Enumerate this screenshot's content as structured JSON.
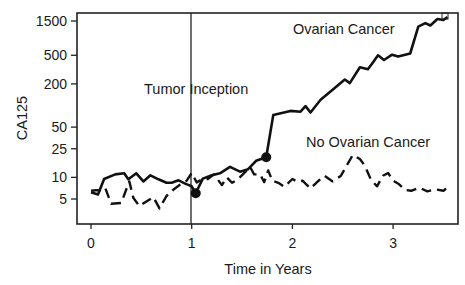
{
  "chart_data": {
    "type": "line",
    "title": "",
    "xlabel": "Time in Years",
    "ylabel": "CA125",
    "xlim": [
      -0.14,
      3.65
    ],
    "ylim_log": [
      2.0,
      2000
    ],
    "yscale": "log",
    "grid": false,
    "legend": "none (inline annotations)",
    "x_ticks": [
      0,
      1,
      2,
      3
    ],
    "x_tick_labels": [
      "0",
      "1",
      "2",
      "3"
    ],
    "y_ticks": [
      5,
      10,
      25,
      50,
      200,
      500,
      1500
    ],
    "y_tick_labels": [
      "5",
      "10",
      "25",
      "50",
      "200",
      "500",
      "1500"
    ],
    "annotations": [
      {
        "text": "Tumor Inception",
        "x": 1.0,
        "type": "vertical-line"
      },
      {
        "text": "Ovarian Cancer",
        "series": "Ovarian Cancer"
      },
      {
        "text": "No Ovarian Cancer",
        "series": "No Ovarian Cancer"
      }
    ],
    "series": [
      {
        "name": "Ovarian Cancer",
        "style": "solid",
        "x": [
          0.0,
          0.07,
          0.13,
          0.24,
          0.33,
          0.37,
          0.45,
          0.52,
          0.59,
          0.67,
          0.75,
          0.8,
          0.87,
          0.94,
          1.0,
          1.04,
          1.11,
          1.2,
          1.28,
          1.38,
          1.48,
          1.56,
          1.64,
          1.74,
          1.81,
          1.98,
          2.08,
          2.13,
          2.18,
          2.28,
          2.42,
          2.52,
          2.57,
          2.67,
          2.75,
          2.79,
          2.85,
          2.91,
          2.99,
          3.05,
          3.12,
          3.17,
          3.25,
          3.32,
          3.37,
          3.44,
          3.5,
          3.54
        ],
        "values": [
          6.2,
          5.8,
          9.5,
          11,
          11.4,
          9.4,
          11.4,
          8.8,
          10.7,
          9.4,
          8.4,
          8.4,
          9.1,
          8.1,
          7.5,
          6.0,
          9.6,
          10.7,
          11.4,
          14,
          12,
          13,
          17,
          19,
          74,
          84,
          82,
          98,
          80,
          120,
          175,
          230,
          205,
          340,
          320,
          380,
          500,
          430,
          510,
          480,
          510,
          530,
          1250,
          1400,
          1300,
          1600,
          1550,
          1700
        ],
        "markers": [
          {
            "x": 1.04,
            "y": 6.0,
            "label": "tumor inception value"
          },
          {
            "x": 1.74,
            "y": 19,
            "label": "detection point"
          }
        ]
      },
      {
        "name": "No Ovarian Cancer",
        "style": "dashed",
        "x": [
          0.0,
          0.05,
          0.1,
          0.14,
          0.2,
          0.3,
          0.38,
          0.42,
          0.48,
          0.55,
          0.62,
          0.68,
          0.75,
          0.82,
          0.88,
          0.95,
          1.0,
          1.05,
          1.1,
          1.16,
          1.22,
          1.3,
          1.35,
          1.4,
          1.46,
          1.53,
          1.58,
          1.62,
          1.68,
          1.72,
          1.76,
          1.8,
          1.86,
          1.92,
          2.0,
          2.05,
          2.1,
          2.18,
          2.26,
          2.32,
          2.4,
          2.48,
          2.55,
          2.6,
          2.67,
          2.72,
          2.78,
          2.84,
          2.9,
          2.95,
          3.0,
          3.06,
          3.12,
          3.18,
          3.26,
          3.34,
          3.42,
          3.5,
          3.54
        ],
        "values": [
          6.5,
          6.6,
          6.6,
          7.2,
          4.3,
          4.4,
          8.8,
          5.2,
          4.0,
          4.6,
          5.3,
          3.7,
          5.5,
          6.8,
          7.8,
          9.0,
          11.5,
          8.5,
          9.4,
          9.5,
          11.0,
          7.8,
          10.0,
          8.4,
          9.4,
          11.8,
          14.0,
          11.0,
          11.0,
          8.6,
          12.5,
          9.0,
          8.4,
          7.4,
          9.5,
          8.7,
          9.0,
          7.0,
          9.0,
          10.5,
          8.8,
          10.4,
          15.5,
          20.5,
          18.0,
          14.5,
          9.3,
          7.5,
          10.5,
          11.5,
          9.0,
          8.0,
          6.7,
          6.5,
          7.2,
          6.4,
          6.8,
          6.5,
          7.3
        ]
      }
    ]
  },
  "labels": {
    "ylabel": "CA125",
    "xlabel": "Time in Years",
    "tumor_inception": "Tumor Inception",
    "ovarian": "Ovarian Cancer",
    "no_ovarian": "No Ovarian Cancer"
  }
}
